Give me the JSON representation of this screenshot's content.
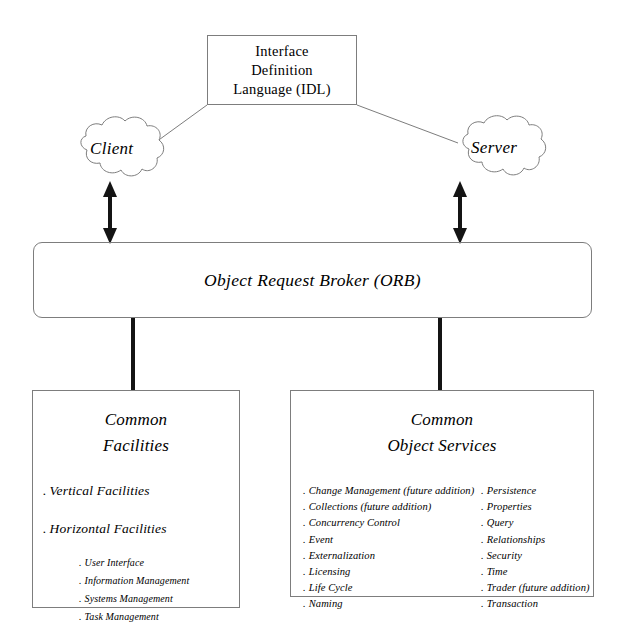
{
  "diagram": {
    "idl": {
      "lines": [
        "Interface",
        "Definition",
        "Language (IDL)"
      ]
    },
    "client": {
      "label": "Client"
    },
    "server": {
      "label": "Server"
    },
    "orb": {
      "label": "Object Request Broker (ORB)"
    },
    "common_facilities": {
      "title_line1": "Common",
      "title_line2": "Facilities",
      "major_items": [
        "Vertical Facilities",
        "Horizontal Facilities"
      ],
      "sub_items": [
        "User Interface",
        "Information Management",
        "Systems Management",
        "Task Management"
      ],
      "bullet": "."
    },
    "common_object_services": {
      "title_line1": "Common",
      "title_line2": "Object Services",
      "bullet": ".",
      "left_column": [
        "Change Management (future addition)",
        "Collections (future addition)",
        "Concurrency  Control",
        "Event",
        "Externalization",
        "Licensing",
        "Life Cycle",
        "Naming"
      ],
      "right_column": [
        "Persistence",
        "Properties",
        "Query",
        "Relationships",
        "Security",
        "Time",
        "Trader (future addition)",
        "Transaction"
      ]
    },
    "connectors": {
      "client_orb_arrow": "double-arrow-vertical",
      "server_orb_arrow": "double-arrow-vertical",
      "idl_client_line": "line",
      "idl_server_line": "line",
      "orb_facilities_line": "thick-line",
      "orb_services_line": "thick-line"
    },
    "colors": {
      "stroke": "#7d7d7d",
      "arrow": "#141414",
      "text": "#000000",
      "background": "#ffffff"
    }
  }
}
